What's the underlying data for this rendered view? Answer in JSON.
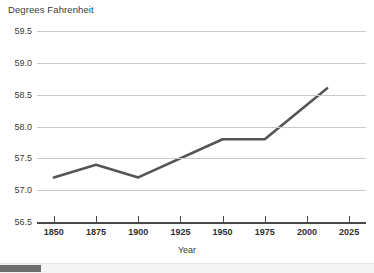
{
  "chart_data": {
    "type": "line",
    "title": "Degrees Fahrenheit",
    "xlabel": "Year",
    "ylabel": "",
    "xlim": [
      1840,
      2035
    ],
    "ylim": [
      56.5,
      59.5
    ],
    "grid": true,
    "legend": false,
    "line_color": "#555555",
    "grid_color": "#c9c9c9",
    "axis_color": "#4a4a4a",
    "background": "#ffffff",
    "ytick_labels": [
      "59.5",
      "59.0",
      "58.5",
      "58.0",
      "57.5",
      "57.0",
      "56.5"
    ],
    "yticks": [
      59.5,
      59.0,
      58.5,
      58.0,
      57.5,
      57.0,
      56.5
    ],
    "xtick_labels": [
      "1850",
      "1875",
      "1900",
      "1925",
      "1950",
      "1975",
      "2000",
      "2025"
    ],
    "xticks": [
      1850,
      1875,
      1900,
      1925,
      1950,
      1975,
      2000,
      2025
    ],
    "x": [
      1850,
      1875,
      1900,
      1950,
      1975,
      2012
    ],
    "values": [
      57.2,
      57.4,
      57.2,
      57.8,
      57.8,
      58.6
    ],
    "series": [
      {
        "name": "Global average temperature",
        "x": [
          1850,
          1875,
          1900,
          1950,
          1975,
          2012
        ],
        "values": [
          57.2,
          57.4,
          57.2,
          57.8,
          57.8,
          58.6
        ]
      }
    ]
  },
  "scrollbar": {
    "orientation": "horizontal",
    "thumb_position": "left"
  }
}
